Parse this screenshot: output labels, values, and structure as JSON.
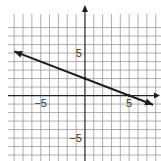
{
  "chart_data": {
    "type": "line",
    "title": "",
    "xlabel": "",
    "ylabel": "",
    "xlim": [
      -8.7,
      8.6
    ],
    "ylim": [
      -7.7,
      9.6
    ],
    "grid": true,
    "grid_step": 1,
    "x_tick_labels": [
      {
        "value": -5,
        "label": "−5"
      },
      {
        "value": 5,
        "label": "5"
      }
    ],
    "y_tick_labels": [
      {
        "value": 5,
        "label": "5"
      },
      {
        "value": -5,
        "label": "−5"
      }
    ],
    "series": [
      {
        "name": "line",
        "equation": "y = -2/5 x + 2",
        "slope": -0.4,
        "intercept": 2,
        "points": [
          [
            -8,
            5.2
          ],
          [
            0,
            2
          ],
          [
            5,
            0
          ],
          [
            7.7,
            -1.08
          ]
        ],
        "arrows": "both"
      }
    ],
    "colors": {
      "grid": "#9a9a9a",
      "axis": "#222222",
      "line": "#1c1c1c"
    }
  }
}
